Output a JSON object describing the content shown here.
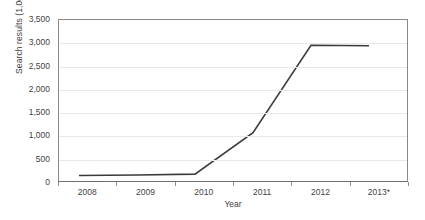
{
  "chart_data": {
    "type": "line",
    "title": "",
    "xlabel": "Year",
    "ylabel": "Search results (1,000)",
    "categories": [
      "2008",
      "2009",
      "2010",
      "2011",
      "2012",
      "2013*"
    ],
    "values": [
      120,
      130,
      150,
      1050,
      2950,
      2940
    ],
    "series": [
      {
        "name": "Search results",
        "values": [
          120,
          130,
          150,
          1050,
          2950,
          2940
        ]
      }
    ],
    "ylim": [
      0,
      3500
    ],
    "ytick_labels": [
      "3,500",
      "3,000",
      "2,500",
      "2,000",
      "1,500",
      "1,000",
      "500",
      "0"
    ],
    "ytick_values": [
      3500,
      3000,
      2500,
      2000,
      1500,
      1000,
      500,
      0
    ],
    "grid": true,
    "legend": "none",
    "line_color": "#3a3a3a",
    "gridline_color": "#e9e9e9",
    "axis_color": "#8a8a8a",
    "background_color": "#ffffff",
    "footnote_marker": "*"
  }
}
